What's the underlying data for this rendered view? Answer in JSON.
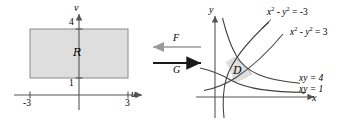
{
  "figure": {
    "colors": {
      "region_fill": "#dedede",
      "region_stroke": "#8a8a8a",
      "axis": "#555555",
      "curve": "#404040",
      "arrow_f": "#9a9a9a",
      "arrow_g": "#1a1a1a",
      "text": "#000000"
    },
    "left_plot": {
      "name": "uv-plane",
      "axis_labels": {
        "horizontal": "u",
        "vertical": "v"
      },
      "tick_labels": {
        "u_left": "-3",
        "u_right": "3",
        "v_bottom": "1",
        "v_top": "4"
      },
      "region_label": "R",
      "region_bounds": {
        "u_min": -3,
        "u_max": 3,
        "v_min": 1,
        "v_max": 4
      }
    },
    "mapping": {
      "forward_label": "F",
      "forward_direction": "left",
      "backward_label": "G",
      "backward_direction": "right"
    },
    "right_plot": {
      "name": "xy-plane",
      "axis_labels": {
        "horizontal": "x",
        "vertical": "y"
      },
      "region_label": "D",
      "curve_labels": [
        {
          "id": "hyperbola-neg3",
          "base": "x",
          "exp1": "2",
          "minus": " - ",
          "base2": "y",
          "exp2": "2",
          "eq": " = -3"
        },
        {
          "id": "hyperbola-pos3",
          "base": "x",
          "exp1": "2",
          "minus": " - ",
          "base2": "y",
          "exp2": "2",
          "eq": " = 3"
        },
        {
          "id": "xy-4",
          "text": "xy = 4"
        },
        {
          "id": "xy-1",
          "text": "xy = 1"
        }
      ]
    }
  }
}
